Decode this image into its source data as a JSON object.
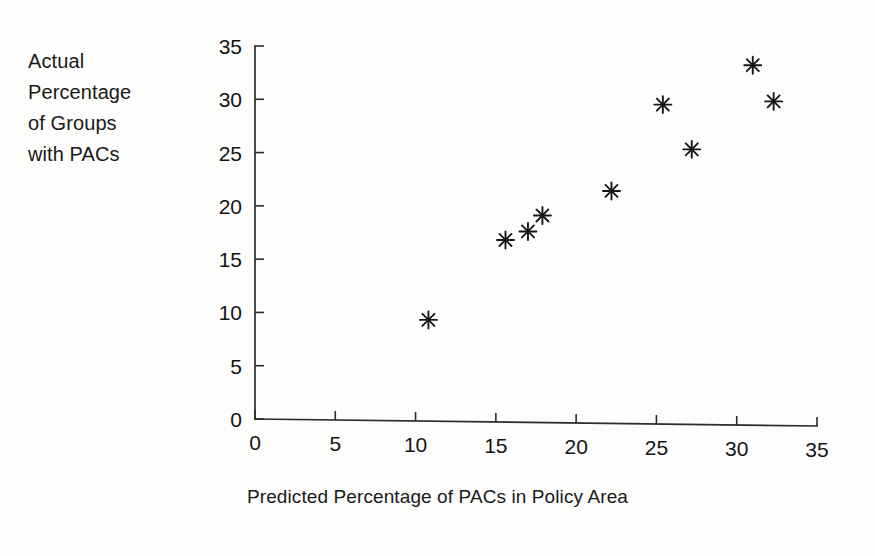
{
  "figure": {
    "background_color": "#fdfdfb",
    "ink_color": "#191919",
    "marker_glyph": "asterisk-8-point"
  },
  "axis_labels": {
    "y_block": "Actual\nPercentage\nof Groups\nwith PACs",
    "x_title": "Predicted Percentage of PACs in Policy Area"
  },
  "chart_data": {
    "type": "scatter",
    "title": "",
    "subtitle": "",
    "xlabel": "Predicted Percentage of PACs in Policy Area",
    "ylabel": "Actual Percentage of Groups with PACs",
    "xlim": [
      0,
      35
    ],
    "ylim": [
      0,
      35
    ],
    "xticks": [
      0,
      5,
      10,
      15,
      20,
      25,
      30,
      35
    ],
    "yticks": [
      0,
      5,
      10,
      15,
      20,
      25,
      30,
      35
    ],
    "xtick_labels": [
      "0",
      "5",
      "10",
      "15",
      "20",
      "25",
      "30",
      "35"
    ],
    "ytick_labels": [
      "0",
      "5",
      "10",
      "15",
      "20",
      "25",
      "30",
      "35"
    ],
    "grid": false,
    "legend": null,
    "legend_position": "none",
    "marker": "*",
    "marker_color": "#161616",
    "series": [
      {
        "name": "Policy areas",
        "points": [
          {
            "x": 10.8,
            "y": 9.3
          },
          {
            "x": 15.6,
            "y": 16.8
          },
          {
            "x": 17.0,
            "y": 17.6
          },
          {
            "x": 17.9,
            "y": 19.1
          },
          {
            "x": 22.2,
            "y": 21.4
          },
          {
            "x": 25.4,
            "y": 29.5
          },
          {
            "x": 27.2,
            "y": 25.3
          },
          {
            "x": 31.0,
            "y": 33.2
          },
          {
            "x": 32.3,
            "y": 29.8
          }
        ]
      }
    ]
  }
}
